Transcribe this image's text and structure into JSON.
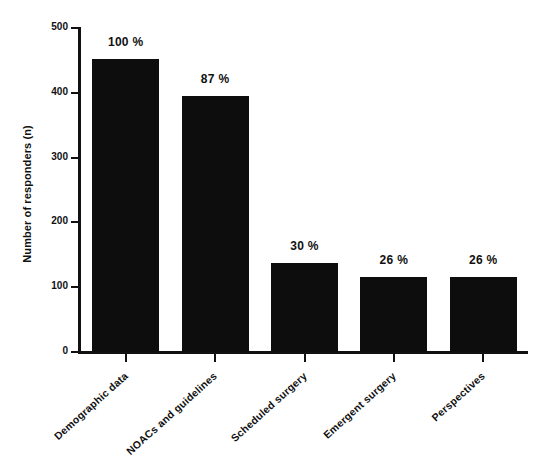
{
  "chart_data": {
    "type": "bar",
    "title": "",
    "subtitle": "",
    "xlabel": "",
    "ylabel": "Number of responders (n)",
    "ylim": [
      0,
      500
    ],
    "yticks": [
      0,
      100,
      200,
      300,
      400,
      500
    ],
    "grid": false,
    "legend": null,
    "bar_color": "#0d0d0d",
    "categories": [
      "Demographic data",
      "NOACs and guidelines",
      "Scheduled surgery",
      "Emergent surgery",
      "Perspectives"
    ],
    "values": [
      452,
      395,
      137,
      116,
      116
    ],
    "data_labels": [
      "100 %",
      "87 %",
      "30 %",
      "26 %",
      "26 %"
    ],
    "percentages": [
      100,
      87,
      30,
      26,
      26
    ]
  },
  "axes": {
    "y_title": "Number of responders (n)",
    "y_tick_labels": [
      "500",
      "400",
      "300",
      "200",
      "100",
      "0"
    ]
  }
}
